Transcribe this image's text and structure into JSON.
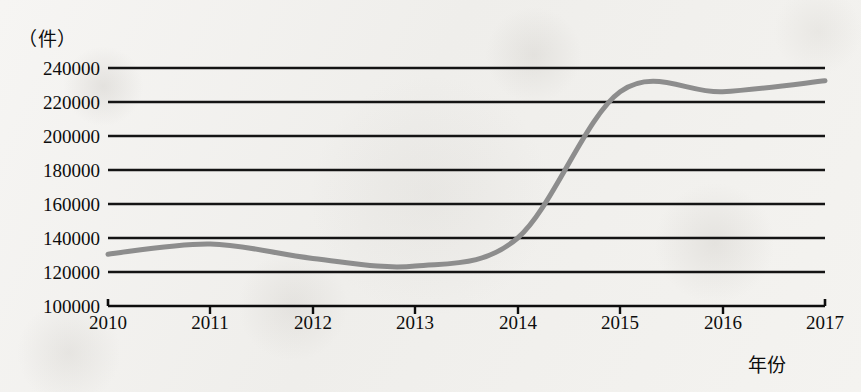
{
  "chart_data": {
    "type": "line",
    "title": "",
    "xlabel": "年份",
    "ylabel": "（件）",
    "unit_label": "（件）",
    "x": [
      2010,
      2011,
      2012,
      2013,
      2014,
      2015,
      2016,
      2017
    ],
    "categories": [
      "2010",
      "2011",
      "2012",
      "2013",
      "2014",
      "2015",
      "2016",
      "2017"
    ],
    "values": [
      130500,
      136500,
      128000,
      123500,
      140000,
      226000,
      226000,
      232500
    ],
    "series": [
      {
        "name": "件数",
        "values": [
          130500,
          136500,
          128000,
          123500,
          140000,
          226000,
          226000,
          232500
        ],
        "color": "#8d8d8d"
      }
    ],
    "ylim": [
      100000,
      240000
    ],
    "ytick_step": 20000,
    "ytick_labels": [
      "240000",
      "220000",
      "200000",
      "180000",
      "160000",
      "140000",
      "120000",
      "100000"
    ],
    "ytick_values": [
      240000,
      220000,
      200000,
      180000,
      160000,
      140000,
      120000,
      100000
    ],
    "xtick_labels": [
      "2010",
      "2011",
      "2012",
      "2013",
      "2014",
      "2015",
      "2016",
      "2017"
    ],
    "xlim": [
      2010,
      2017
    ],
    "grid": "horizontal",
    "legend": "none",
    "annotations": [
      "local minimum near late 2012 at about 122500",
      "local maximum mid-2015 at about 229500",
      "slight dip near 2016 at about 226000"
    ],
    "colors": {
      "line": "#8d8d8d",
      "grid": "#1a1a1a",
      "axis": "#0d0d0d",
      "background": "#f2f1ee"
    }
  }
}
